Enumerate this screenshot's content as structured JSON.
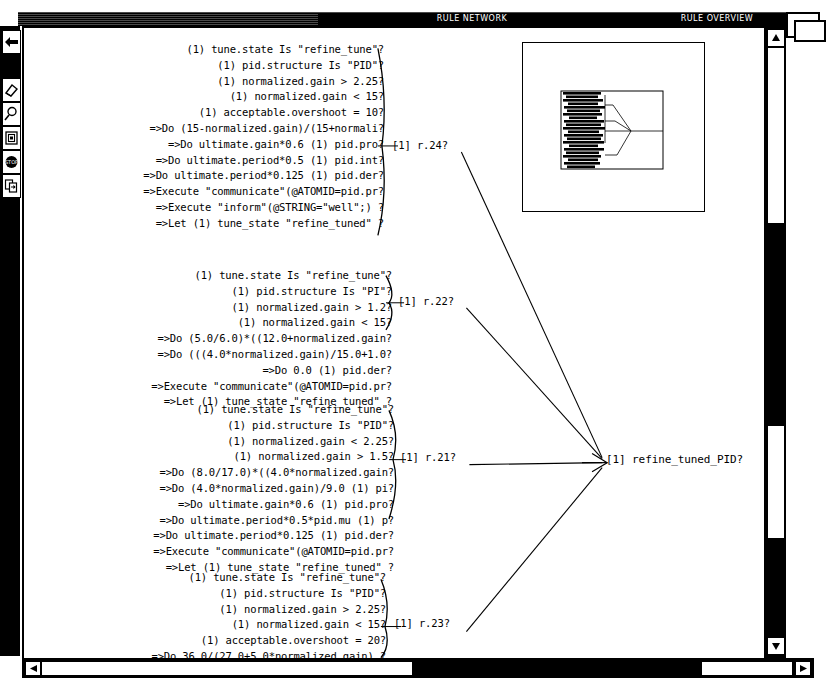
{
  "window": {
    "titles": [
      {
        "label": "RULE NETWORK",
        "left": 300,
        "width": 300
      },
      {
        "label": "RULE OVERVIEW",
        "left": 600,
        "width": 190
      }
    ]
  },
  "toolbar": {
    "items": [
      {
        "name": "back-arrow-icon",
        "label": "Back"
      },
      {
        "name": "eraser-icon",
        "label": "Erase"
      },
      {
        "name": "magnifier-icon",
        "label": "Zoom"
      },
      {
        "name": "document-icon",
        "label": "Document"
      },
      {
        "name": "stop-icon",
        "label": "STOP"
      },
      {
        "name": "copy-page-icon",
        "label": "Copy"
      }
    ]
  },
  "network": {
    "rule_blocks": [
      {
        "id": "r24",
        "node_label": "[1] r.24?",
        "lines": [
          "(1) tune.state Is \"refine_tune\"?",
          "(1) pid.structure Is \"PID\"?",
          "(1) normalized.gain > 2.25?",
          "(1) normalized.gain < 15?",
          "(1) acceptable.overshoot = 10?",
          "=>Do (15-normalized.gain)/(15+normali?",
          "=>Do ultimate.gain*0.6 (1) pid.pro?",
          "=>Do ultimate.period*0.5 (1) pid.int?",
          "=>Do ultimate.period*0.125 (1) pid.der?",
          "=>Execute \"communicate\"(@ATOMID=pid.pr?",
          "=>Execute \"inform\"(@STRING=\"well\";) ?",
          "=>Let (1) tune_state \"refine_tuned\" ?"
        ]
      },
      {
        "id": "r22",
        "node_label": "[1] r.22?",
        "lines": [
          "(1) tune.state Is \"refine_tune\"?",
          "(1) pid.structure Is \"PI\"?",
          "(1) normalized.gain > 1.2?",
          "(1) normalized.gain < 15?",
          "=>Do (5.0/6.0)*((12.0+normalized.gain?",
          "=>Do (((4.0*normalized.gain)/15.0+1.0?",
          "=>Do 0.0 (1) pid.der?",
          "=>Execute \"communicate\"(@ATOMID=pid.pr?",
          "=>Let (1) tune_state \"refine_tuned\" ?"
        ]
      },
      {
        "id": "r21",
        "node_label": "[1] r.21?",
        "lines": [
          "(1) tune.state Is \"refine_tune\"?",
          "(1) pid.structure Is \"PID\"?",
          "(1) normalized.gain < 2.25?",
          "(1) normalized.gain > 1.5?",
          "=>Do (8.0/17.0)*((4.0*normalized.gain?",
          "=>Do (4.0*normalized.gain)/9.0 (1) pi?",
          "=>Do ultimate.gain*0.6 (1) pid.pro?",
          "=>Do ultimate.period*0.5*pid.mu (1) p?",
          "=>Do ultimate.period*0.125 (1) pid.der?",
          "=>Execute \"communicate\"(@ATOMID=pid.pr?",
          "=>Let (1) tune_state \"refine_tuned\" ?"
        ]
      },
      {
        "id": "r23",
        "node_label": "[1] r.23?",
        "lines": [
          "(1) tune.state Is \"refine_tune\"?",
          "(1) pid.structure Is \"PID\"?",
          "(1) normalized.gain > 2.25?",
          "(1) normalized.gain < 15?",
          "(1) acceptable.overshoot = 20?",
          "=>Do 36.0/(27.0+5.0*normalized.gain) ?",
          "=>Do ultimate.gain*0.6 (1) pid.pro?",
          "=>Do ultimate.period*0.5 (1) pid.int?"
        ]
      }
    ],
    "output_node": "[1] refine_tuned_PID?"
  },
  "overview": {
    "name": "rule-overview-thumbnail"
  },
  "colors": {
    "frame": "#000000",
    "background": "#ffffff",
    "titlebar_text": "#ffffff"
  }
}
